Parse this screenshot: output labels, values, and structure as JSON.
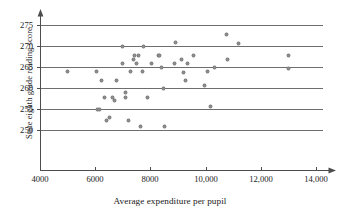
{
  "chart_data": {
    "type": "scatter",
    "title": "",
    "xlabel": "Average expenditure per pupil",
    "ylabel": "State eighth grade reading score",
    "xlim": [
      4000,
      14800
    ],
    "ylim": [
      247,
      277
    ],
    "grid": "horizontal",
    "legend": "none",
    "xticks": [
      4000,
      6000,
      8000,
      10000,
      12000,
      14000
    ],
    "xtick_labels": [
      "4000",
      "6000",
      "8000",
      "10,000",
      "12,000",
      "14,000"
    ],
    "yticks": [
      250,
      255,
      260,
      265,
      270,
      275
    ],
    "ytick_labels": [
      "250",
      "255",
      "260",
      "265",
      "270",
      "275"
    ],
    "point_color": "#8c8c8c",
    "gridline_color": "#6e6e6e",
    "axis_color": "#4d4d4d",
    "points": [
      {
        "x": 5000,
        "y": 264.0
      },
      {
        "x": 6060,
        "y": 264.0
      },
      {
        "x": 6080,
        "y": 255.0
      },
      {
        "x": 6160,
        "y": 255.0
      },
      {
        "x": 6220,
        "y": 261.9
      },
      {
        "x": 6350,
        "y": 257.8
      },
      {
        "x": 6420,
        "y": 252.2
      },
      {
        "x": 6520,
        "y": 253.0
      },
      {
        "x": 6620,
        "y": 257.8
      },
      {
        "x": 6700,
        "y": 257.0
      },
      {
        "x": 6760,
        "y": 261.9
      },
      {
        "x": 6980,
        "y": 265.9
      },
      {
        "x": 7000,
        "y": 269.8
      },
      {
        "x": 7080,
        "y": 258.9
      },
      {
        "x": 7100,
        "y": 257.8
      },
      {
        "x": 7220,
        "y": 252.2
      },
      {
        "x": 7280,
        "y": 263.9
      },
      {
        "x": 7380,
        "y": 266.9
      },
      {
        "x": 7420,
        "y": 267.8
      },
      {
        "x": 7500,
        "y": 265.8
      },
      {
        "x": 7560,
        "y": 267.8
      },
      {
        "x": 7640,
        "y": 250.9
      },
      {
        "x": 7700,
        "y": 263.9
      },
      {
        "x": 7760,
        "y": 269.8
      },
      {
        "x": 7880,
        "y": 257.8
      },
      {
        "x": 8040,
        "y": 265.8
      },
      {
        "x": 8280,
        "y": 267.8
      },
      {
        "x": 8340,
        "y": 267.8
      },
      {
        "x": 8420,
        "y": 264.8
      },
      {
        "x": 8480,
        "y": 259.9
      },
      {
        "x": 8520,
        "y": 250.9
      },
      {
        "x": 8880,
        "y": 265.8
      },
      {
        "x": 8920,
        "y": 270.8
      },
      {
        "x": 9120,
        "y": 266.8
      },
      {
        "x": 9200,
        "y": 263.8
      },
      {
        "x": 9260,
        "y": 261.9
      },
      {
        "x": 9340,
        "y": 265.8
      },
      {
        "x": 9560,
        "y": 267.8
      },
      {
        "x": 9960,
        "y": 260.7
      },
      {
        "x": 10080,
        "y": 263.9
      },
      {
        "x": 10160,
        "y": 255.7
      },
      {
        "x": 10340,
        "y": 264.8
      },
      {
        "x": 10760,
        "y": 272.8
      },
      {
        "x": 10800,
        "y": 266.8
      },
      {
        "x": 11200,
        "y": 270.6
      },
      {
        "x": 13000,
        "y": 267.8
      },
      {
        "x": 13020,
        "y": 264.7
      }
    ]
  },
  "axis": {
    "y_title": "State eighth grade reading score",
    "x_title": "Average expenditure per pupil"
  }
}
